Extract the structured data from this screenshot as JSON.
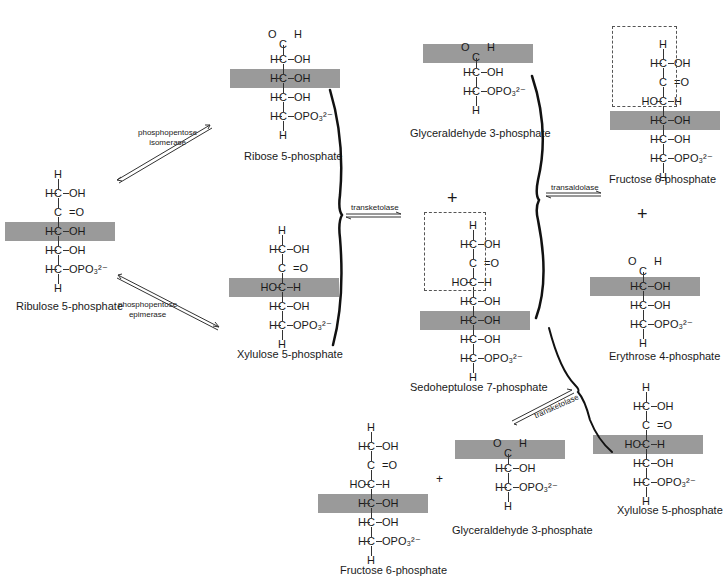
{
  "diagram": {
    "shade_color": "#9a9a9a",
    "molecules": [
      {
        "id": "ribulose5p",
        "name": "Ribulose 5-phosphate",
        "rows": [
          {
            "l": "",
            "c": "H",
            "r": ""
          },
          {
            "l": "H",
            "c": "C",
            "r": "OH"
          },
          {
            "l": "",
            "c": "C",
            "r": "=O"
          },
          {
            "l": "H",
            "c": "C",
            "r": "OH",
            "shaded": true
          },
          {
            "l": "H",
            "c": "C",
            "r": "OH"
          },
          {
            "l": "H",
            "c": "C",
            "r": "OPO₃²⁻"
          },
          {
            "l": "",
            "c": "H",
            "r": ""
          }
        ]
      },
      {
        "id": "ribose5p",
        "name": "Ribose 5-phosphate",
        "rows": [
          {
            "aldehyde": true,
            "o": "O",
            "h": "H",
            "c": "C"
          },
          {
            "l": "H",
            "c": "C",
            "r": "OH"
          },
          {
            "l": "H",
            "c": "C",
            "r": "OH",
            "shaded": true
          },
          {
            "l": "H",
            "c": "C",
            "r": "OH"
          },
          {
            "l": "H",
            "c": "C",
            "r": "OPO₃²⁻"
          },
          {
            "l": "",
            "c": "H",
            "r": ""
          }
        ]
      },
      {
        "id": "xylulose5p_a",
        "name": "Xylulose 5-phosphate",
        "rows": [
          {
            "l": "",
            "c": "H",
            "r": ""
          },
          {
            "l": "H",
            "c": "C",
            "r": "OH"
          },
          {
            "l": "",
            "c": "C",
            "r": "=O"
          },
          {
            "l": "HO",
            "c": "C",
            "r": "H",
            "shaded": true
          },
          {
            "l": "H",
            "c": "C",
            "r": "OH"
          },
          {
            "l": "H",
            "c": "C",
            "r": "OPO₃²⁻"
          },
          {
            "l": "",
            "c": "H",
            "r": ""
          }
        ]
      },
      {
        "id": "glyceraldehyde3p_a",
        "name": "Glyceraldehyde 3-phosphate",
        "rows": [
          {
            "aldehyde": true,
            "o": "O",
            "h": "H",
            "c": "C",
            "shaded": true
          },
          {
            "l": "H",
            "c": "C",
            "r": "OH"
          },
          {
            "l": "H",
            "c": "C",
            "r": "OPO₃²⁻"
          },
          {
            "l": "",
            "c": "H",
            "r": ""
          }
        ]
      },
      {
        "id": "sedoheptulose7p",
        "name": "Sedoheptulose 7-phosphate",
        "dashed_rows": [
          0,
          3
        ],
        "rows": [
          {
            "l": "",
            "c": "H",
            "r": ""
          },
          {
            "l": "H",
            "c": "C",
            "r": "OH"
          },
          {
            "l": "",
            "c": "C",
            "r": "=O"
          },
          {
            "l": "HO",
            "c": "C",
            "r": "H"
          },
          {
            "l": "H",
            "c": "C",
            "r": "OH"
          },
          {
            "l": "H",
            "c": "C",
            "r": "OH",
            "shaded": true
          },
          {
            "l": "H",
            "c": "C",
            "r": "OH"
          },
          {
            "l": "H",
            "c": "C",
            "r": "OPO₃²⁻"
          },
          {
            "l": "",
            "c": "H",
            "r": ""
          }
        ]
      },
      {
        "id": "fructose6p_a",
        "name": "Fructose 6-phosphate",
        "dashed_rows": [
          0,
          3
        ],
        "rows": [
          {
            "l": "",
            "c": "H",
            "r": ""
          },
          {
            "l": "H",
            "c": "C",
            "r": "OH"
          },
          {
            "l": "",
            "c": "C",
            "r": "=O"
          },
          {
            "l": "HO",
            "c": "C",
            "r": "H"
          },
          {
            "l": "H",
            "c": "C",
            "r": "OH",
            "shaded": true
          },
          {
            "l": "H",
            "c": "C",
            "r": "OH"
          },
          {
            "l": "H",
            "c": "C",
            "r": "OPO₃²⁻"
          },
          {
            "l": "",
            "c": "H",
            "r": ""
          }
        ]
      },
      {
        "id": "erythrose4p",
        "name": "Erythrose 4-phosphate",
        "rows": [
          {
            "aldehyde": true,
            "o": "O",
            "h": "H",
            "c": "C"
          },
          {
            "l": "H",
            "c": "C",
            "r": "OH",
            "shaded": true
          },
          {
            "l": "H",
            "c": "C",
            "r": "OH"
          },
          {
            "l": "H",
            "c": "C",
            "r": "OPO₃²⁻"
          },
          {
            "l": "",
            "c": "H",
            "r": ""
          }
        ]
      },
      {
        "id": "xylulose5p_b",
        "name": "Xylulose 5-phosphate",
        "rows": [
          {
            "l": "",
            "c": "H",
            "r": ""
          },
          {
            "l": "H",
            "c": "C",
            "r": "OH"
          },
          {
            "l": "",
            "c": "C",
            "r": "=O"
          },
          {
            "l": "HO",
            "c": "C",
            "r": "H",
            "shaded": true
          },
          {
            "l": "H",
            "c": "C",
            "r": "OH"
          },
          {
            "l": "H",
            "c": "C",
            "r": "OPO₃²⁻"
          },
          {
            "l": "",
            "c": "H",
            "r": ""
          }
        ]
      },
      {
        "id": "fructose6p_b",
        "name": "Fructose 6-phosphate",
        "rows": [
          {
            "l": "",
            "c": "H",
            "r": ""
          },
          {
            "l": "H",
            "c": "C",
            "r": "OH"
          },
          {
            "l": "",
            "c": "C",
            "r": "=O"
          },
          {
            "l": "HO",
            "c": "C",
            "r": "H"
          },
          {
            "l": "H",
            "c": "C",
            "r": "OH",
            "shaded": true
          },
          {
            "l": "H",
            "c": "C",
            "r": "OH"
          },
          {
            "l": "H",
            "c": "C",
            "r": "OPO₃²⁻"
          },
          {
            "l": "",
            "c": "H",
            "r": ""
          }
        ]
      },
      {
        "id": "glyceraldehyde3p_b",
        "name": "Glyceraldehyde 3-phosphate",
        "rows": [
          {
            "aldehyde": true,
            "o": "O",
            "h": "H",
            "c": "C",
            "shaded": true
          },
          {
            "l": "H",
            "c": "C",
            "r": "OH"
          },
          {
            "l": "H",
            "c": "C",
            "r": "OPO₃²⁻"
          },
          {
            "l": "",
            "c": "H",
            "r": ""
          }
        ]
      }
    ],
    "enzymes": {
      "isomerase_1": "phosphopentose",
      "isomerase_2": "isomerase",
      "epimerase_1": "phosphopentose",
      "epimerase_2": "epimerase",
      "transketolase_1": "transketolase",
      "transaldolase": "transaldolase",
      "transketolase_2": "transketolase"
    },
    "plus_sign": "+"
  }
}
